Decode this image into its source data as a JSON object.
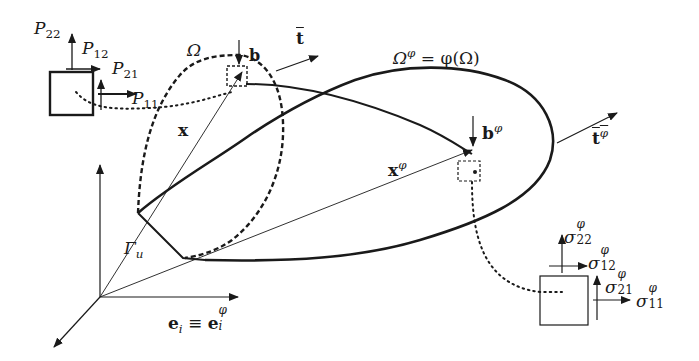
{
  "figure": {
    "background": "#ffffff",
    "ink": "#1a1a1a"
  },
  "labels": {
    "omega": {
      "sym": "Ω"
    },
    "omega_phi": {
      "sym": "Ω",
      "sup": "φ",
      "rest": " = φ(Ω)"
    },
    "t_bar": {
      "sym": "t"
    },
    "t_bar_phi": {
      "sym": "t",
      "sup": "φ"
    },
    "b": {
      "sym": "b"
    },
    "b_phi": {
      "sym": "b",
      "sup": "φ"
    },
    "x": {
      "sym": "x"
    },
    "x_phi": {
      "sym": "x",
      "sup": "φ"
    },
    "gamma_u": {
      "sym": "Γ",
      "sub": "u"
    },
    "basis": {
      "left": "e",
      "left_sub": "i",
      "equiv": " ≡ ",
      "right": "e",
      "right_sub": "i",
      "right_sup": "φ"
    },
    "P22": {
      "sym": "P",
      "sub": "22"
    },
    "P12": {
      "sym": "P",
      "sub": "12"
    },
    "P21": {
      "sym": "P",
      "sub": "21"
    },
    "P11": {
      "sym": "P",
      "sub": "11"
    },
    "s22": {
      "sym": "σ",
      "sub": "22",
      "sup": "φ"
    },
    "s12": {
      "sym": "σ",
      "sub": "12",
      "sup": "φ"
    },
    "s21": {
      "sym": "σ",
      "sub": "21",
      "sup": "φ"
    },
    "s11": {
      "sym": "σ",
      "sub": "11",
      "sup": "φ"
    }
  }
}
